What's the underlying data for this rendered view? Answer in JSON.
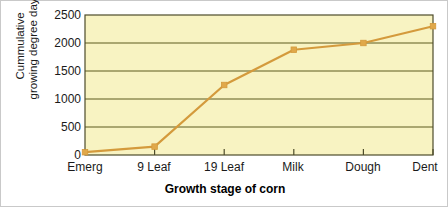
{
  "chart_data": {
    "type": "line",
    "title": "",
    "xlabel": "Growth stage of corn",
    "ylabel": "Cummulative\ngrowing degree days",
    "ylabel_line1": "Cummulative",
    "ylabel_line2": "growing degree days",
    "categories": [
      "Emerg",
      "9 Leaf",
      "19 Leaf",
      "Milk",
      "Dough",
      "Dent"
    ],
    "values": [
      50,
      150,
      1250,
      1880,
      2000,
      2300
    ],
    "series": [
      {
        "name": "Cummulative growing degree days",
        "values": [
          50,
          150,
          1250,
          1880,
          2000,
          2300
        ]
      }
    ],
    "ylim": [
      0,
      2500
    ],
    "yticks": [
      0,
      500,
      1000,
      1500,
      2000,
      2500
    ],
    "ytick_labels": [
      "0",
      "500",
      "1000",
      "1500",
      "2000",
      "2500"
    ],
    "grid": true,
    "grid_axis": "y",
    "legend": "none",
    "markers": "square",
    "colors": {
      "line": "#d49a3c",
      "marker": "#e0a84a",
      "plot_background": "#f8f3c2",
      "gridline": "#5c5a1e",
      "axis": "#4d4b2a",
      "text": "#1a1a1a",
      "figure_background": "#ffffff",
      "figure_border": "#c9c9c9"
    }
  }
}
